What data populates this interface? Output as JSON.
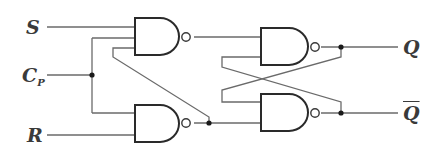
{
  "diagram": {
    "type": "clocked RS flip-flop (NAND gates)",
    "inputs": {
      "s": "S",
      "cp_main": "C",
      "cp_sub": "P",
      "r": "R"
    },
    "outputs": {
      "q": "Q",
      "q_bar": "Q"
    },
    "gates": [
      {
        "id": "G1",
        "kind": "NAND",
        "position": "top-left"
      },
      {
        "id": "G2",
        "kind": "NAND",
        "position": "bottom-left"
      },
      {
        "id": "G3",
        "kind": "NAND",
        "position": "top-right"
      },
      {
        "id": "G4",
        "kind": "NAND",
        "position": "bottom-right"
      }
    ],
    "colors": {
      "wire": "#6a6a6a",
      "gate": "#2a2a2a",
      "background": "#ffffff"
    }
  }
}
